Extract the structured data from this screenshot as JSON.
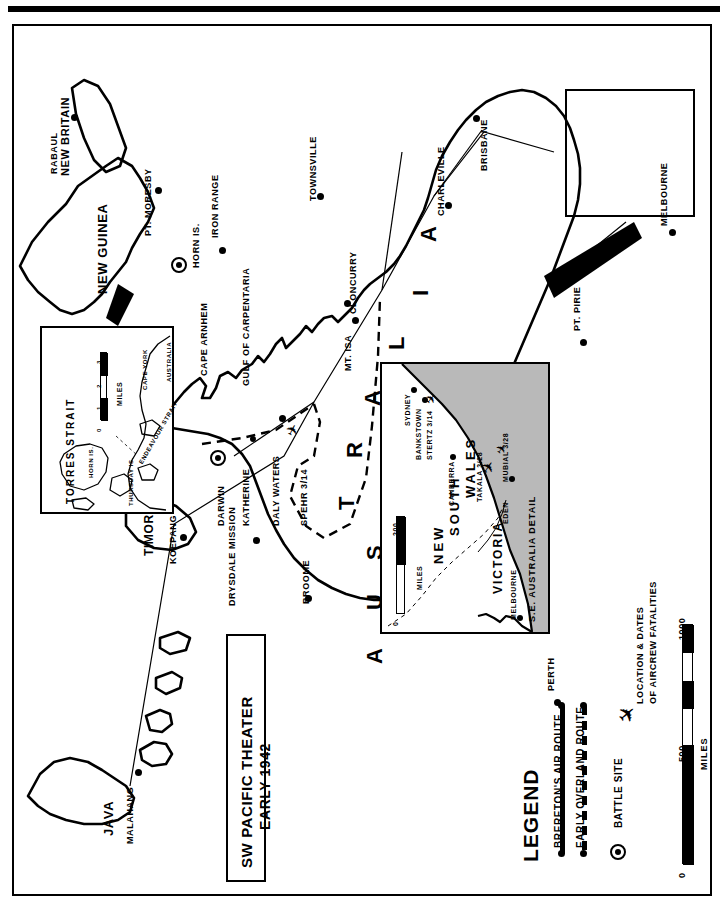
{
  "title_box": {
    "line1": "SW PACIFIC THEATER",
    "line2": "EARLY 1942"
  },
  "main_map": {
    "regions": [
      {
        "name": "NEW BRITAIN",
        "label": "NEW BRITAIN"
      },
      {
        "name": "NEW GUINEA",
        "label": "NEW GUINEA"
      },
      {
        "name": "AUSTRALIA",
        "label": "AUSTRALIA"
      },
      {
        "name": "JAVA",
        "label": "JAVA"
      },
      {
        "name": "TIMOR",
        "label": "TIMOR"
      },
      {
        "name": "GULF OF CARPENTARIA",
        "label": "GULF OF CARPENTARIA"
      },
      {
        "name": "CAPE ARNHEM",
        "label": "CAPE ARNHEM"
      },
      {
        "name": "IRON RANGE",
        "label": "IRON RANGE"
      }
    ],
    "places": [
      {
        "label": "RABAUL"
      },
      {
        "label": "PT. MORESBY"
      },
      {
        "label": "HORN IS."
      },
      {
        "label": "TOWNSVILLE"
      },
      {
        "label": "BRISBANE"
      },
      {
        "label": "CHARLEVILLE"
      },
      {
        "label": "CLONCURRY"
      },
      {
        "label": "MT. ISA"
      },
      {
        "label": "MELBOURNE"
      },
      {
        "label": "PT. PIRIE"
      },
      {
        "label": "DARWIN"
      },
      {
        "label": "KATHERINE"
      },
      {
        "label": "DALY WATERS"
      },
      {
        "label": "DRYSDALE MISSION"
      },
      {
        "label": "BROOME"
      },
      {
        "label": "PERTH"
      },
      {
        "label": "KOEPANG"
      },
      {
        "label": "MALAHANG"
      }
    ],
    "fatalities": [
      {
        "label": "SPEHR 3/14"
      }
    ]
  },
  "torres_inset": {
    "title": "TORRES STRAIT",
    "labels": [
      "HORN IS.",
      "THURSDAY IS.",
      "ENDEAVOUR STRAIT",
      "CAPE YORK",
      "AUSTRALIA"
    ],
    "scale": {
      "ticks": [
        "0",
        "1",
        "2",
        "3"
      ],
      "unit": "MILES"
    }
  },
  "se_inset": {
    "title": "S.E. AUSTRALIA DETAIL",
    "states": [
      "NEW SOUTH WALES",
      "VICTORIA"
    ],
    "places": [
      "SYDNEY",
      "BANKSTOWN",
      "CANBERRA",
      "EDEN",
      "MELBOURNE"
    ],
    "fatalities": [
      "STERTZ 3/14",
      "TAKALA 3/28",
      "MUBIAL 3/28"
    ],
    "scale": {
      "ticks": [
        "0",
        "200"
      ],
      "unit": "MILES"
    }
  },
  "legend": {
    "title": "LEGEND",
    "items": [
      {
        "label": "BRERETON'S AIR ROUTE",
        "symbol": "solid-line-with-dots"
      },
      {
        "label": "EARLY OVERLAND ROUTE",
        "symbol": "dashed-line-with-dots"
      },
      {
        "label": "BATTLE SITE",
        "symbol": "circled-dot"
      },
      {
        "label": "LOCATION & DATES",
        "label2": "OF AIRCREW FATALITIES",
        "symbol": "airplane"
      }
    ]
  },
  "scale": {
    "ticks": [
      "0",
      "500",
      "1000"
    ],
    "unit": "MILES"
  },
  "colors": {
    "ink": "#000000",
    "paper": "#ffffff",
    "sea_tint": "#b9b9b9"
  }
}
